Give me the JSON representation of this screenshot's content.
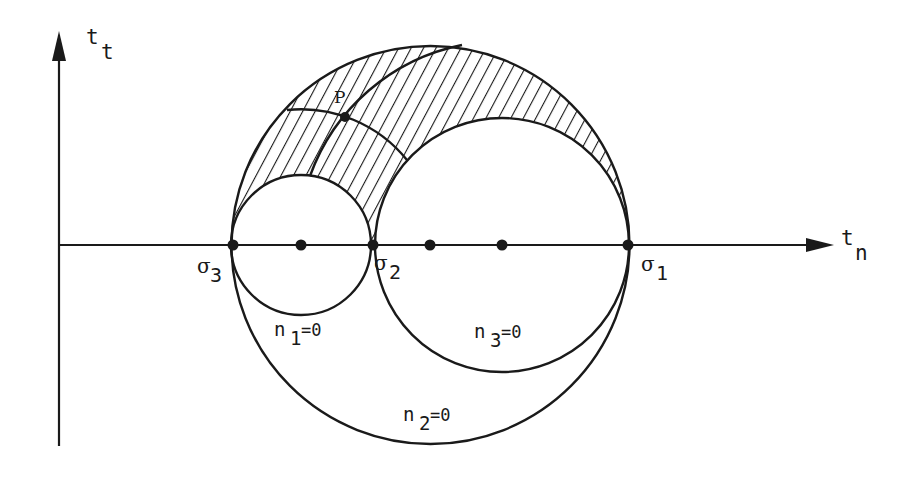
{
  "figure": {
    "type": "mohr_circles_3d_stress",
    "axes": {
      "x_label": "t",
      "x_label_sub": "n",
      "y_label": "t",
      "y_label_sub": "t"
    },
    "points": [
      {
        "id": "sigma3",
        "label": "σ",
        "sub": "3",
        "x": 233
      },
      {
        "id": "c1",
        "label": "",
        "sub": "",
        "x": 301
      },
      {
        "id": "sigma2",
        "label": "σ",
        "sub": "2",
        "x": 373
      },
      {
        "id": "c2",
        "label": "",
        "sub": "",
        "x": 430
      },
      {
        "id": "c3",
        "label": "",
        "sub": "",
        "x": 502
      },
      {
        "id": "sigma1",
        "label": "σ",
        "sub": "1",
        "x": 628
      }
    ],
    "circles": [
      {
        "id": "n1",
        "label": "n",
        "sub": "1",
        "eq": "=0",
        "cx": 301,
        "r": 70
      },
      {
        "id": "n3",
        "label": "n",
        "sub": "3",
        "eq": "=0",
        "cx": 502,
        "r": 127
      },
      {
        "id": "n2",
        "label": "n",
        "sub": "2",
        "eq": "=0",
        "cx": 430.5,
        "r": 199
      }
    ],
    "point_P": {
      "label": "P"
    },
    "colors": {
      "ink": "#1a1a1a",
      "background": "#ffffff"
    }
  }
}
